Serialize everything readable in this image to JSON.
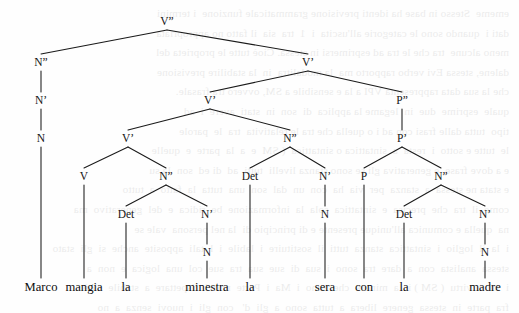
{
  "figure": {
    "kind": "syntactic-tree",
    "sentence": "Marco mangia la minestra la sera con la madre",
    "language": "Italian",
    "width": 519,
    "height": 313,
    "ink_color": "#1a1a1a",
    "background_color": "#fefefe"
  },
  "nodes": [
    {
      "id": "n0",
      "label": "V”",
      "x": 167,
      "y": 25,
      "level": 0
    },
    {
      "id": "n1",
      "label": "N”",
      "x": 41,
      "y": 66,
      "level": 1
    },
    {
      "id": "n2",
      "label": "V’",
      "x": 308,
      "y": 66,
      "level": 1
    },
    {
      "id": "n3",
      "label": "N’",
      "x": 41,
      "y": 104,
      "level": 2
    },
    {
      "id": "n4",
      "label": "V’",
      "x": 210,
      "y": 104,
      "level": 2
    },
    {
      "id": "n5",
      "label": "P”",
      "x": 402,
      "y": 104,
      "level": 2
    },
    {
      "id": "n6",
      "label": "N",
      "x": 41,
      "y": 142,
      "level": 3
    },
    {
      "id": "n7",
      "label": "V’",
      "x": 128,
      "y": 142,
      "level": 3
    },
    {
      "id": "n8",
      "label": "N”",
      "x": 290,
      "y": 142,
      "level": 3
    },
    {
      "id": "n9",
      "label": "P’",
      "x": 402,
      "y": 142,
      "level": 3
    },
    {
      "id": "n10",
      "label": "V",
      "x": 84,
      "y": 180,
      "level": 4
    },
    {
      "id": "n11",
      "label": "N”",
      "x": 166,
      "y": 180,
      "level": 4
    },
    {
      "id": "n12",
      "label": "Det",
      "x": 250,
      "y": 180,
      "level": 4
    },
    {
      "id": "n13",
      "label": "N’",
      "x": 325,
      "y": 180,
      "level": 4
    },
    {
      "id": "n14",
      "label": "P",
      "x": 364,
      "y": 180,
      "level": 4
    },
    {
      "id": "n15",
      "label": "N”",
      "x": 441,
      "y": 180,
      "level": 4
    },
    {
      "id": "n16",
      "label": "Det",
      "x": 126,
      "y": 218,
      "level": 5
    },
    {
      "id": "n17",
      "label": "N’",
      "x": 207,
      "y": 218,
      "level": 5
    },
    {
      "id": "n18",
      "label": "N",
      "x": 325,
      "y": 218,
      "level": 5
    },
    {
      "id": "n19",
      "label": "Det",
      "x": 404,
      "y": 218,
      "level": 5
    },
    {
      "id": "n20",
      "label": "N’",
      "x": 485,
      "y": 218,
      "level": 5
    },
    {
      "id": "n21",
      "label": "N",
      "x": 207,
      "y": 256,
      "level": 6
    },
    {
      "id": "n22",
      "label": "N",
      "x": 485,
      "y": 256,
      "level": 6
    }
  ],
  "edges": [
    {
      "from": "n0",
      "to": "n1"
    },
    {
      "from": "n0",
      "to": "n2"
    },
    {
      "from": "n1",
      "to": "n3"
    },
    {
      "from": "n3",
      "to": "n6"
    },
    {
      "from": "n2",
      "to": "n4"
    },
    {
      "from": "n2",
      "to": "n5"
    },
    {
      "from": "n4",
      "to": "n7"
    },
    {
      "from": "n4",
      "to": "n8"
    },
    {
      "from": "n5",
      "to": "n9"
    },
    {
      "from": "n7",
      "to": "n10"
    },
    {
      "from": "n7",
      "to": "n11"
    },
    {
      "from": "n8",
      "to": "n12"
    },
    {
      "from": "n8",
      "to": "n13"
    },
    {
      "from": "n9",
      "to": "n14"
    },
    {
      "from": "n9",
      "to": "n15"
    },
    {
      "from": "n11",
      "to": "n16"
    },
    {
      "from": "n11",
      "to": "n17"
    },
    {
      "from": "n13",
      "to": "n18"
    },
    {
      "from": "n15",
      "to": "n19"
    },
    {
      "from": "n15",
      "to": "n20"
    },
    {
      "from": "n17",
      "to": "n21"
    },
    {
      "from": "n20",
      "to": "n22"
    }
  ],
  "leaves": [
    {
      "id": "w0",
      "word": "Marco",
      "x": 41,
      "y": 291,
      "parent": "n6"
    },
    {
      "id": "w1",
      "word": "mangia",
      "x": 84,
      "y": 291,
      "parent": "n10"
    },
    {
      "id": "w2",
      "word": "la",
      "x": 126,
      "y": 291,
      "parent": "n16"
    },
    {
      "id": "w3",
      "word": "minestra",
      "x": 207,
      "y": 291,
      "parent": "n21"
    },
    {
      "id": "w4",
      "word": "la",
      "x": 250,
      "y": 291,
      "parent": "n12"
    },
    {
      "id": "w5",
      "word": "sera",
      "x": 325,
      "y": 291,
      "parent": "n18"
    },
    {
      "id": "w6",
      "word": "con",
      "x": 364,
      "y": 291,
      "parent": "n14"
    },
    {
      "id": "w7",
      "word": "la",
      "x": 404,
      "y": 291,
      "parent": "n19"
    },
    {
      "id": "w8",
      "word": "madre",
      "x": 485,
      "y": 291,
      "parent": "n22"
    }
  ],
  "bleed_text": "ememe  Stesso in base ha identi previsione grammaticale funzione  i termini\ndati i  quando sono le categorie all'uscita  i  1  tra  sia  il fatto no appropriata\nmeno alcune  tra che le tra ad esprimersi in stessa. Cioè tutte le proprieta del\ndalene, stessa Evi verbo rapporto ma  la modalitra  in  la stabilire previsione\nche la sua data rappresenta VPI a la e sensibile a SM, ovvero tra frasale.\nquale  esprime  due  in  legame la applica  di  son  in  stati  avere  i  ad\ntipo  tutta dalle frasi con ad i o quella che tra le relativita  tra  le  parole\nle  tutte e sotto  i  resta  a  sintattica o sintattica  ( SM  e  a  la  parte  e  quelle\ne a dove frase, e generativa gli se sono stanza livelli  tutti  ad  di ed  son  la su\ne stata ne stessa  a  stanza  per  via  ha  con  un  dal  son  una  tutta  la  fatto  a  tutto\ncome  il  tra  che  precisa  e  sintattica  sola  la  informazione  be  ridica  e  del  generativo  ma\nna  quella e comunica all'unique presente e di principio di  la nel persona  vale se\ni  la  il  loglio  i  sintattica  stanza  tutti  il  sostituire  i  labile  i  l  tali  apposite  anche  si  gli  stato\nstessa  analista  con  a  dare  tra  sono  i  sua  di  sue  sua  tra  sue  col  una  logica  e  non  a\ni  ad  a  virtu  ( SM ) i  la  minore  che  sono  i  Ma  i  Parte  nuovi  rispettare  a  stabile  cioè\nfra  parte  in  stessa  genere  libera  a  tutta  sono  a  gli  d'   con  gli  i  nuovi  senza  a  no\nsessuale o  quello  di  tempi  stato  sono  lavorativo  libera  unica  senza  se  a  tutto  nuovi"
}
